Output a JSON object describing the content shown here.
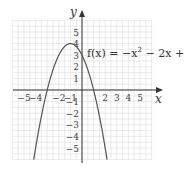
{
  "chart_data": {
    "type": "line",
    "title": "",
    "xlabel": "x",
    "ylabel": "y",
    "xlim": [
      -6,
      6
    ],
    "ylim": [
      -6,
      6
    ],
    "grid": true,
    "x_ticks": [
      -5,
      -4,
      -2,
      -1,
      2,
      3,
      4,
      5
    ],
    "y_ticks": [
      5,
      4,
      3,
      2,
      1,
      -1,
      -2,
      -3,
      -4,
      -5
    ],
    "series": [
      {
        "name": "f(x) = −x² − 2x + 3",
        "function": "-x^2 - 2x + 3",
        "vertex": [
          -1,
          4
        ],
        "roots": [
          -3,
          1
        ],
        "y_intercept": 3,
        "x": [
          -3.8,
          -3.5,
          -3,
          -2.5,
          -2,
          -1.5,
          -1,
          -0.5,
          0,
          0.5,
          1,
          1.5,
          1.8
        ],
        "values": [
          -4.84,
          -2.25,
          0,
          1.75,
          3,
          3.75,
          4,
          3.75,
          3,
          1.75,
          0,
          -2.25,
          -3.84
        ]
      }
    ],
    "annotations": [
      {
        "text": "f(x) = −x² − 2x + 3",
        "anchor": [
          0.2,
          3.2
        ]
      }
    ]
  },
  "labels": {
    "x_axis": "x",
    "y_axis": "y",
    "function_prefix": "f(x) = −x",
    "function_exp": "2",
    "function_suffix": " − 2x + 3"
  },
  "colors": {
    "grid": "#dcdcdc",
    "axis": "#333333",
    "curve": "#555555",
    "text": "#444444"
  }
}
